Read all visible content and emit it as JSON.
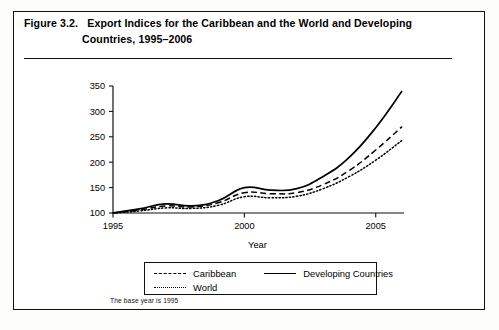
{
  "figure": {
    "number": "Figure 3.2.",
    "title_line_1": "Export Indices for the Caribbean and the World and Developing",
    "title_line_2": "Countries, 1995–2006",
    "footnote": "The base year is 1995"
  },
  "legend": {
    "items": [
      {
        "label": "Caribbean",
        "style": "dashed",
        "swatch": "dash-line-icon"
      },
      {
        "label": "Developing Countries",
        "style": "solid",
        "swatch": "solid-line-icon"
      },
      {
        "label": "World",
        "style": "dotted",
        "swatch": "dotted-line-icon"
      }
    ]
  },
  "chart_data": {
    "type": "line",
    "title": "Export Indices for the Caribbean and the World and Developing Countries, 1995–2006",
    "xlabel": "Year",
    "ylabel": "",
    "x": [
      1995,
      1996,
      1997,
      1998,
      1999,
      2000,
      2001,
      2002,
      2003,
      2004,
      2005,
      2006
    ],
    "xlim": [
      1995,
      2006
    ],
    "ylim": [
      100,
      350
    ],
    "xticks": [
      1995,
      2000,
      2005
    ],
    "xticklabels": [
      "1995",
      "2000",
      "2005"
    ],
    "yticks": [
      100,
      150,
      200,
      250,
      300,
      350
    ],
    "yticklabels": [
      "100",
      "150",
      "200",
      "250",
      "300",
      "350"
    ],
    "grid": false,
    "legend_position": "below-axes",
    "note": "The base year is 1995",
    "series": [
      {
        "name": "Developing Countries",
        "style": "solid",
        "color": "#000000",
        "values": [
          100,
          108,
          118,
          114,
          124,
          150,
          145,
          148,
          172,
          210,
          268,
          340
        ]
      },
      {
        "name": "Caribbean",
        "style": "dashed",
        "color": "#000000",
        "values": [
          100,
          106,
          114,
          112,
          120,
          140,
          138,
          140,
          156,
          184,
          224,
          270
        ]
      },
      {
        "name": "World",
        "style": "dotted",
        "color": "#000000",
        "values": [
          100,
          104,
          110,
          109,
          115,
          132,
          130,
          133,
          148,
          172,
          204,
          243
        ]
      }
    ]
  }
}
